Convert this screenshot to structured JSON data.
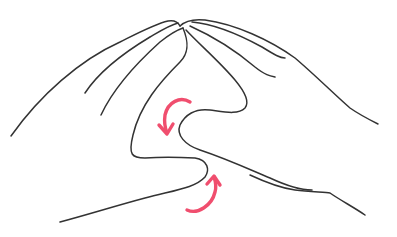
{
  "illustration": {
    "subject": "hands-gesture-line-drawing",
    "description": "Two hands with fingertips touching at top forming a peak; thumbs interlocking in center with two rotation arrows",
    "colors": {
      "line": "#333333",
      "arrow": "#f04e6e",
      "background": "#ffffff"
    },
    "arrows": [
      {
        "name": "rotate-arrow-top",
        "direction": "counter-clockwise downward"
      },
      {
        "name": "rotate-arrow-bottom",
        "direction": "upward"
      }
    ]
  }
}
